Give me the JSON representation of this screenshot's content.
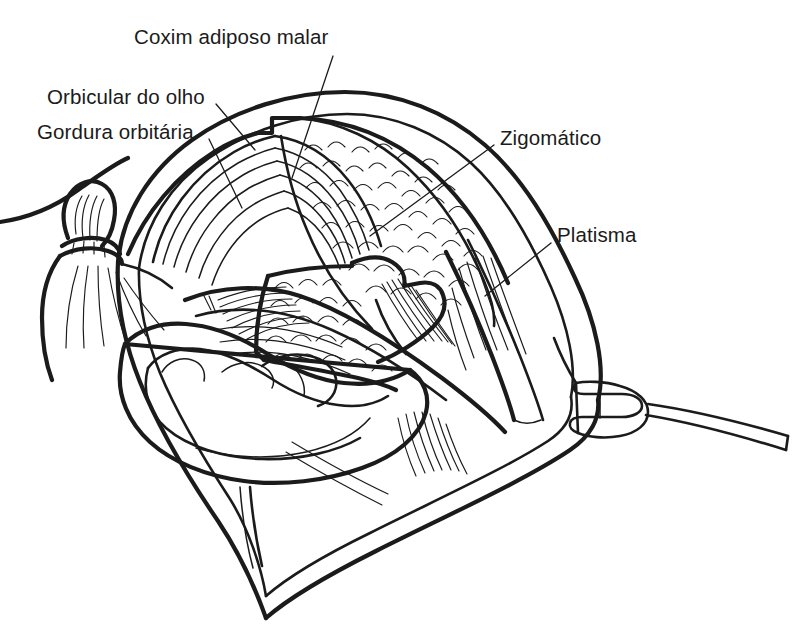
{
  "figure": {
    "kind": "anatomical-line-drawing",
    "language": "pt-BR",
    "background_color": "#ffffff",
    "line_color": "#1b1b1b",
    "text_color": "#1b1b1b",
    "width": 801,
    "height": 642
  },
  "labels": [
    {
      "id": "coxim-adiposo-malar",
      "text": "Coxim adiposo malar",
      "x": 134,
      "y": 26,
      "leader": {
        "from": [
          333,
          56
        ],
        "to": [
          292,
          178
        ]
      }
    },
    {
      "id": "orbicular-do-olho",
      "text": "Orbicular do olho",
      "x": 47,
      "y": 86,
      "leader": {
        "from": [
          216,
          104
        ],
        "to": [
          255,
          150
        ]
      }
    },
    {
      "id": "gordura-orbitaria",
      "text": "Gordura orbitária",
      "x": 37,
      "y": 121,
      "leader": {
        "from": [
          209,
          139
        ],
        "to": [
          242,
          208
        ]
      }
    },
    {
      "id": "zigomatico",
      "text": "Zigomático",
      "x": 500,
      "y": 127,
      "leader": {
        "from": [
          494,
          145
        ],
        "to": [
          370,
          236
        ]
      }
    },
    {
      "id": "platisma",
      "text": "Platisma",
      "x": 557,
      "y": 224,
      "leader": {
        "from": [
          551,
          243
        ],
        "to": [
          485,
          296
        ]
      }
    }
  ],
  "structures": [
    {
      "id": "skin-flap-outline",
      "name": "Retalho cutâneo elevado"
    },
    {
      "id": "orbicularis-oculi",
      "name": "Músculo orbicular do olho"
    },
    {
      "id": "orbital-fat",
      "name": "Gordura orbitária"
    },
    {
      "id": "malar-fat-pad",
      "name": "Coxim adiposo malar"
    },
    {
      "id": "zygomaticus-muscle",
      "name": "Músculo zigomático"
    },
    {
      "id": "buccal-fat-pad",
      "name": "Coxim adiposo bucal"
    },
    {
      "id": "platysma-muscle",
      "name": "Músculo platisma"
    },
    {
      "id": "auricle",
      "name": "Pavilhão auricular"
    },
    {
      "id": "sutured-flap-tag",
      "name": "Retalho suturado"
    },
    {
      "id": "skin-hook-retractor",
      "name": "Gancho retrator cirúrgico"
    }
  ]
}
